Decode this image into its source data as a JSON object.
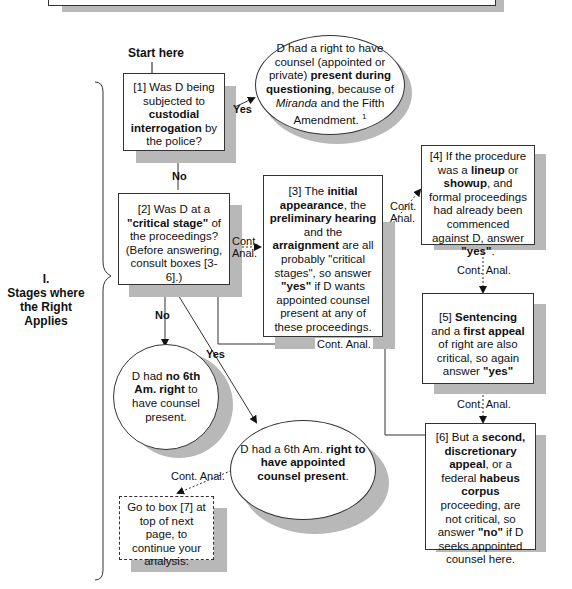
{
  "section": {
    "numeral": "I.",
    "title": "Stages where the Right Applies"
  },
  "start_label": "Start here",
  "nodes": {
    "box1": {
      "id": "[1]",
      "parts": [
        "Was D being subjected to ",
        "custodial interrogation",
        " by the police?"
      ]
    },
    "oval_miranda": {
      "parts": [
        "D had a right to have counsel (appointed or private) ",
        "present during questioning",
        ", because of ",
        "Miranda",
        " and the Fifth Amendment.",
        "1"
      ]
    },
    "box2": {
      "id": "[2]",
      "parts": [
        "Was D at a ",
        "\"critical stage\"",
        " of the proceedings? (Before answering, consult boxes [3-6].)"
      ]
    },
    "box3": {
      "id": "[3]",
      "parts": [
        "The ",
        "initial appearance",
        ", the ",
        "preliminary hearing",
        " and the ",
        "arraignment",
        " are all probably \"critical stages\", so answer ",
        "\"yes\"",
        " if D wants appointed counsel present at any of these proceedings."
      ]
    },
    "box4": {
      "id": "[4]",
      "parts": [
        "If the procedure was a ",
        "lineup",
        " or ",
        "showup",
        ", and formal proceedings had already been commenced against D, answer ",
        "\"yes\"",
        "."
      ]
    },
    "box5": {
      "id": "[5]",
      "parts": [
        "Sentencing",
        " and a ",
        "first appeal",
        " of right are also critical, so again answer ",
        "\"yes\""
      ]
    },
    "box6": {
      "id": "[6]",
      "parts": [
        "But a ",
        "second, discretionary appeal",
        ", or a federal ",
        "habeus corpus",
        " proceeding, are not critical, so answer ",
        "\"no\"",
        " if D seeks appointed counsel here."
      ]
    },
    "oval_no_right": {
      "parts": [
        "D had ",
        "no 6th Am. right",
        " to have counsel present."
      ]
    },
    "oval_right": {
      "parts": [
        "D had a 6th Am.  ",
        "right to have appointed counsel present",
        "."
      ]
    },
    "box_goto": {
      "text": "Go to box [7] at top of next page, to continue your analysis."
    }
  },
  "edges": {
    "yes1": "Yes",
    "no1": "No",
    "no2": "No",
    "yes2": "Yes",
    "cont_anal": "Cont. Anal."
  }
}
